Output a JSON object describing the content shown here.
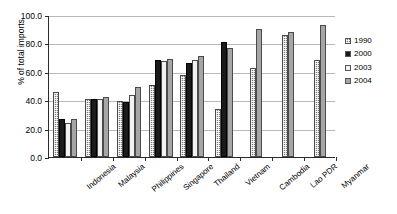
{
  "chart_data": {
    "type": "bar",
    "title": "",
    "xlabel": "",
    "ylabel": "% of total imports",
    "ylim": [
      0,
      100
    ],
    "yticks": [
      "0.0",
      "20.0",
      "40.0",
      "60.0",
      "80.0",
      "100.0"
    ],
    "ytick_values": [
      0,
      20,
      40,
      60,
      80,
      100
    ],
    "grid": true,
    "legend_position": "right",
    "categories": [
      "Indonesia",
      "Malaysia",
      "Philippines",
      "Singapore",
      "Thailand",
      "Vietnam",
      "Cambodia",
      "Lao PDR",
      "Myanmar"
    ],
    "series": [
      {
        "name": "1990",
        "color": "#7d7d7d",
        "fill": "dotted-gray",
        "values": [
          46.0,
          41.0,
          39.5,
          51.0,
          57.5,
          34.0,
          63.0,
          86.0,
          68.0
        ]
      },
      {
        "name": "2000",
        "color": "#1a1a1a",
        "fill": "solid-black",
        "values": [
          27.0,
          40.8,
          39.0,
          68.5,
          66.5,
          81.0,
          null,
          null,
          null
        ]
      },
      {
        "name": "2003",
        "color": "#f2f2f2",
        "fill": "white",
        "values": [
          24.0,
          41.0,
          43.5,
          67.5,
          68.0,
          null,
          null,
          null,
          null
        ]
      },
      {
        "name": "2004",
        "color": "#a6a6a6",
        "fill": "solid-gray",
        "values": [
          26.5,
          42.0,
          49.5,
          69.0,
          71.0,
          77.0,
          90.0,
          88.0,
          93.0
        ]
      }
    ]
  },
  "legend": {
    "items": [
      {
        "label": "1990"
      },
      {
        "label": "2000"
      },
      {
        "label": "2003"
      },
      {
        "label": "2004"
      }
    ]
  }
}
